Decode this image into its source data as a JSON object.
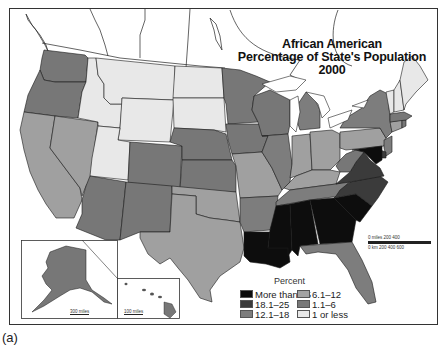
{
  "map": {
    "title_line1": "African American",
    "title_line2": "Percentage of State's Population",
    "title_line3": "2000",
    "colors": {
      "more_than_25": "#0d0d0d",
      "18_1_25": "#3b3b3b",
      "12_1_18": "#7a7a7a",
      "6_1_12": "#9e9e9e",
      "1_1_6": "#777777",
      "1_or_less": "#e8e8e8"
    },
    "legend": {
      "heading": "Percent",
      "items": [
        {
          "label": "More than 25",
          "color": "#0d0d0d"
        },
        {
          "label": "18.1–25",
          "color": "#3b3b3b"
        },
        {
          "label": "12.1–18",
          "color": "#7d7d7d"
        },
        {
          "label": "6.1–12",
          "color": "#a3a3a3"
        },
        {
          "label": "1.1–6",
          "color": "#787878"
        },
        {
          "label": "1 or less",
          "color": "#e8e8e8"
        }
      ]
    },
    "scale": {
      "miles_label": "0 miles      200     400",
      "km_label": "0 km    200        400        600"
    },
    "insets": {
      "alaska_scale": "300 miles",
      "hawaii_scale": "100 miles"
    },
    "states": {
      "WA": "1.1–6",
      "OR": "1.1–6",
      "CA": "6.1–12",
      "NV": "6.1–12",
      "ID": "1 or less",
      "MT": "1 or less",
      "WY": "1 or less",
      "UT": "1 or less",
      "CO": "1.1–6",
      "AZ": "1.1–6",
      "NM": "1.1–6",
      "ND": "1 or less",
      "SD": "1 or less",
      "NE": "1.1–6",
      "KS": "1.1–6",
      "OK": "6.1–12",
      "TX": "6.1–12",
      "MN": "1.1–6",
      "IA": "1.1–6",
      "MO": "6.1–12",
      "AR": "12.1–18",
      "LA": "More than 25",
      "WI": "1.1–6",
      "IL": "12.1–18",
      "MI": "12.1–18",
      "IN": "6.1–12",
      "OH": "6.1–12",
      "KY": "6.1–12",
      "TN": "12.1–18",
      "MS": "More than 25",
      "AL": "More than 25",
      "GA": "More than 25",
      "SC": "More than 25",
      "NC": "18.1–25",
      "VA": "18.1–25",
      "WV": "1.1–6",
      "FL": "12.1–18",
      "PA": "6.1–12",
      "NY": "12.1–18",
      "NJ": "12.1–18",
      "DE": "18.1–25",
      "MD": "More than 25",
      "CT": "6.1–12",
      "RI": "1.1–6",
      "MA": "1.1–6",
      "VT": "1 or less",
      "NH": "1 or less",
      "ME": "1 or less",
      "AK": "1.1–6",
      "HI": "1.1–6"
    }
  },
  "caption": "(a)"
}
